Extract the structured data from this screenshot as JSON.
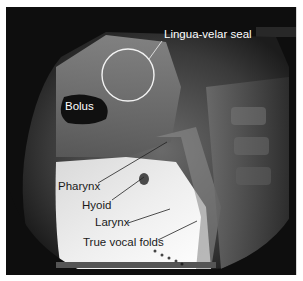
{
  "figure": {
    "type": "fluoroscopy-xray"
  },
  "labels": {
    "lingua_velar_seal": "Lingua-velar seal",
    "bolus": "Bolus",
    "pharynx": "Pharynx",
    "hyoid": "Hyoid",
    "larynx": "Larynx",
    "true_vocal_folds": "True vocal folds"
  },
  "colors": {
    "background": "#0e0e0e",
    "annotation_light": "#ffffff",
    "annotation_dark": "#1a1a1a"
  }
}
